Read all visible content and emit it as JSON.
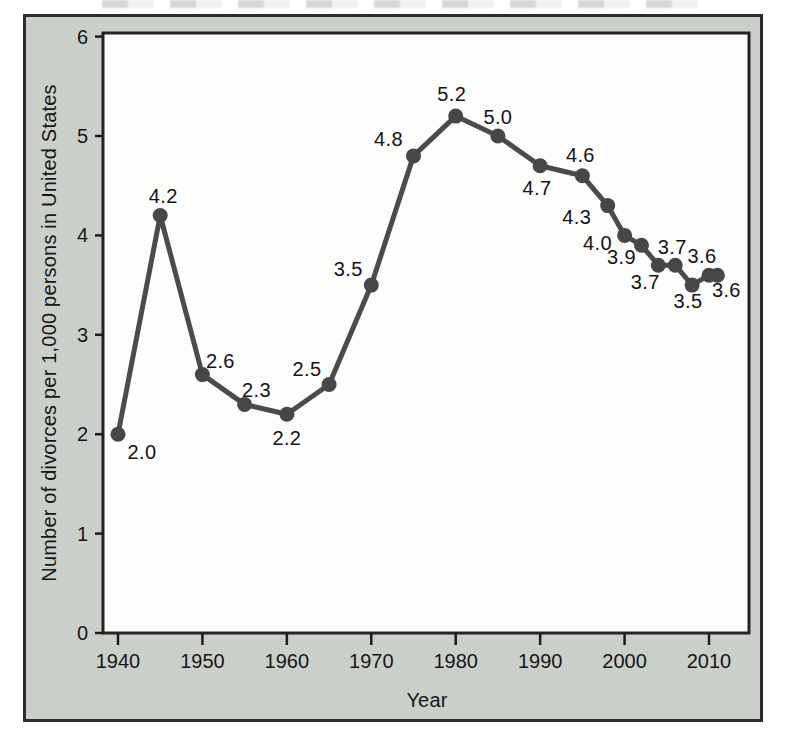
{
  "figure": {
    "frame_color": "#2d2d2d",
    "background": "#cbcfca",
    "plot_background": "#fdfdfc",
    "plot_border_color": "#232323",
    "tick_color": "#1c1c1c",
    "text_color": "#161616"
  },
  "chart_data": {
    "type": "line",
    "title": "",
    "xlabel": "Year",
    "ylabel": "Number of divorces per 1,000 persons in United States",
    "x_ticks": [
      1940,
      1950,
      1960,
      1970,
      1980,
      1990,
      2000,
      2010
    ],
    "y_ticks": [
      0,
      1,
      2,
      3,
      4,
      5,
      6
    ],
    "xlim": [
      1938,
      2015
    ],
    "ylim": [
      0,
      6
    ],
    "grid": false,
    "legend": null,
    "series": [
      {
        "name": "divorces-per-1000-persons-us",
        "line_color": "#4b4b4b",
        "marker_color": "#474747",
        "points": [
          {
            "year": 1940,
            "value": 2.0,
            "label": "2.0",
            "label_dx": 24,
            "label_dy": 18
          },
          {
            "year": 1945,
            "value": 4.2,
            "label": "4.2",
            "label_dx": 3,
            "label_dy": -20
          },
          {
            "year": 1950,
            "value": 2.6,
            "label": "2.6",
            "label_dx": 18,
            "label_dy": -14
          },
          {
            "year": 1955,
            "value": 2.3,
            "label": "2.3",
            "label_dx": 12,
            "label_dy": -14
          },
          {
            "year": 1960,
            "value": 2.2,
            "label": "2.2",
            "label_dx": 0,
            "label_dy": 24
          },
          {
            "year": 1965,
            "value": 2.5,
            "label": "2.5",
            "label_dx": -22,
            "label_dy": -16
          },
          {
            "year": 1970,
            "value": 3.5,
            "label": "3.5",
            "label_dx": -23,
            "label_dy": -16
          },
          {
            "year": 1975,
            "value": 4.8,
            "label": "4.8",
            "label_dx": -25,
            "label_dy": -17
          },
          {
            "year": 1980,
            "value": 5.2,
            "label": "5.2",
            "label_dx": -4,
            "label_dy": -22
          },
          {
            "year": 1985,
            "value": 5.0,
            "label": "5.0",
            "label_dx": 0,
            "label_dy": -19
          },
          {
            "year": 1990,
            "value": 4.7,
            "label": "4.7",
            "label_dx": -3,
            "label_dy": 22
          },
          {
            "year": 1995,
            "value": 4.6,
            "label": "4.6",
            "label_dx": -2,
            "label_dy": -21
          },
          {
            "year": 1998,
            "value": 4.3,
            "label": "4.3",
            "label_dx": -31,
            "label_dy": 11
          },
          {
            "year": 2000,
            "value": 4.0,
            "label": "4.0",
            "label_dx": -27,
            "label_dy": 8
          },
          {
            "year": 2002,
            "value": 3.9,
            "label": "3.9",
            "label_dx": -20,
            "label_dy": 12
          },
          {
            "year": 2004,
            "value": 3.7,
            "label": "3.7",
            "label_dx": -13,
            "label_dy": 17
          },
          {
            "year": 2006,
            "value": 3.7,
            "label": "3.7",
            "label_dx": -3,
            "label_dy": -18
          },
          {
            "year": 2008,
            "value": 3.5,
            "label": "3.5",
            "label_dx": -4,
            "label_dy": 16
          },
          {
            "year": 2010,
            "value": 3.6,
            "label": "3.6",
            "label_dx": -7,
            "label_dy": -19
          },
          {
            "year": 2011,
            "value": 3.6,
            "label": "3.6",
            "label_dx": 9,
            "label_dy": 15
          }
        ]
      }
    ]
  }
}
